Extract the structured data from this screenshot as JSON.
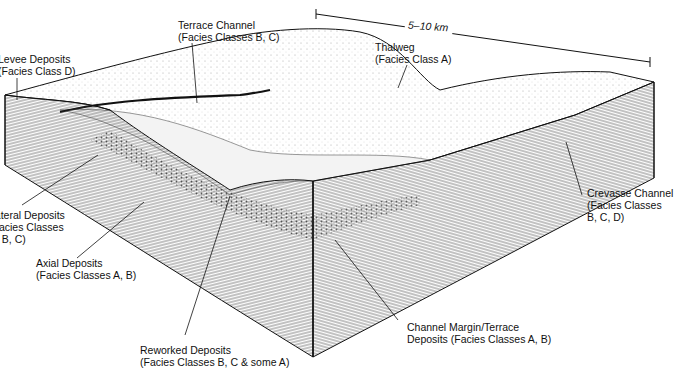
{
  "figure": {
    "scale_bar": {
      "label": "5–10 km"
    },
    "colors": {
      "ink": "#111111",
      "background": "#ffffff",
      "shade": "#555555"
    },
    "labels": [
      {
        "id": "levee",
        "line1": "Levee Deposits",
        "line2": "(Facies Class D)",
        "line3": ""
      },
      {
        "id": "terrace-channel",
        "line1": "Terrace Channel",
        "line2": "(Facies Classes B, C)",
        "line3": ""
      },
      {
        "id": "thalweg",
        "line1": "Thalweg",
        "line2": "(Facies Class A)",
        "line3": ""
      },
      {
        "id": "lateral",
        "line1": "Lateral Deposits",
        "line2": "(Facies Classes",
        "line3": "A, B, C)"
      },
      {
        "id": "axial",
        "line1": "Axial Deposits",
        "line2": "(Facies Classes A, B)",
        "line3": ""
      },
      {
        "id": "crevasse",
        "line1": "Crevasse Channel",
        "line2": "(Facies Classes",
        "line3": "B, C, D)"
      },
      {
        "id": "reworked",
        "line1": "Reworked Deposits",
        "line2": "(Facies Classes B, C & some A)",
        "line3": ""
      },
      {
        "id": "margin",
        "line1": "Channel Margin/Terrace",
        "line2": "Deposits (Facies Classes A, B)",
        "line3": ""
      }
    ]
  }
}
